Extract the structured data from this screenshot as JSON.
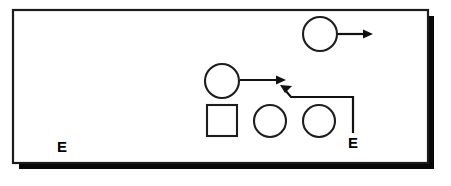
{
  "diagram": {
    "type": "play-diagram",
    "background_color": "#ffffff",
    "panel": {
      "name": "field-panel",
      "fill": "#ffffff",
      "stroke": "#1b1b1b",
      "shadow_color": "#080808",
      "x": 13,
      "y": 10,
      "width": 415,
      "height": 153,
      "shadow_offset_x": 6,
      "shadow_offset_y": 6
    },
    "players": [
      {
        "id": "player-top-circle",
        "shape": "circle",
        "label": "",
        "cx": 320,
        "cy": 34,
        "r": 17
      },
      {
        "id": "player-mid-circle",
        "shape": "circle",
        "label": "",
        "cx": 222,
        "cy": 81,
        "r": 17
      },
      {
        "id": "player-square",
        "shape": "square",
        "label": "",
        "x": 207,
        "y": 105,
        "width": 30,
        "height": 31
      },
      {
        "id": "player-bottom-circle-1",
        "shape": "circle",
        "label": "",
        "cx": 270,
        "cy": 121,
        "r": 16
      },
      {
        "id": "player-bottom-circle-2",
        "shape": "circle",
        "label": "",
        "cx": 319,
        "cy": 121,
        "r": 16
      }
    ],
    "routes": [
      {
        "id": "route-top",
        "from": "player-top-circle",
        "direction": "right",
        "start_x": 338,
        "start_y": 34,
        "end_x": 372,
        "end_y": 34,
        "has_arrowhead": true
      },
      {
        "id": "route-middle",
        "from": "player-mid-circle",
        "direction": "right",
        "start_x": 240,
        "start_y": 81,
        "end_x": 285,
        "end_y": 81,
        "has_arrowhead": true
      },
      {
        "id": "route-end-motion",
        "from": "end-label-right",
        "direction": "up-left",
        "points": "353,131 353,97 290,97 283,88",
        "has_arrowhead": true
      }
    ],
    "labels": [
      {
        "id": "end-label-left",
        "text": "E",
        "x": 62,
        "y": 152
      },
      {
        "id": "end-label-right",
        "text": "E",
        "x": 354,
        "y": 148
      }
    ]
  }
}
